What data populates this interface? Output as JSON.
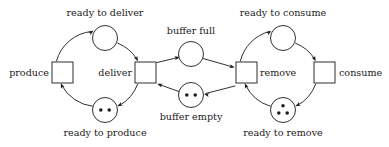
{
  "diagram": {
    "kind": "petri-net",
    "colors": {
      "stroke": "#1a1a1a",
      "fill": "#ffffff",
      "token": "#1a1a1a",
      "background": "#ffffff"
    },
    "places": [
      {
        "id": "ready-to-deliver",
        "label": "ready to deliver",
        "tokens": 0,
        "cx": 105,
        "cy": 38,
        "r": 12.5,
        "label_x": 105,
        "label_y": 16,
        "label_anchor": "middle"
      },
      {
        "id": "ready-to-produce",
        "label": "ready to produce",
        "tokens": 2,
        "cx": 105,
        "cy": 110,
        "r": 12.5,
        "label_x": 105,
        "label_y": 136,
        "label_anchor": "middle"
      },
      {
        "id": "buffer-full",
        "label": "buffer full",
        "tokens": 0,
        "cx": 191,
        "cy": 54,
        "r": 12.5,
        "label_x": 191,
        "label_y": 34,
        "label_anchor": "middle"
      },
      {
        "id": "buffer-empty",
        "label": "buffer empty",
        "tokens": 2,
        "cx": 191,
        "cy": 95,
        "r": 12.5,
        "label_x": 191,
        "label_y": 120,
        "label_anchor": "middle"
      },
      {
        "id": "ready-to-consume",
        "label": "ready to consume",
        "tokens": 0,
        "cx": 283,
        "cy": 38,
        "r": 12.5,
        "label_x": 283,
        "label_y": 16,
        "label_anchor": "middle"
      },
      {
        "id": "ready-to-remove",
        "label": "ready to remove",
        "tokens": 3,
        "cx": 283,
        "cy": 110,
        "r": 12.5,
        "label_x": 283,
        "label_y": 136,
        "label_anchor": "middle"
      }
    ],
    "transitions": [
      {
        "id": "produce",
        "label": "produce",
        "x": 52,
        "y": 62,
        "w": 21,
        "h": 21,
        "label_x": 49,
        "label_y": 76,
        "label_anchor": "end"
      },
      {
        "id": "deliver",
        "label": "deliver",
        "x": 135,
        "y": 62,
        "w": 21,
        "h": 21,
        "label_x": 132,
        "label_y": 76,
        "label_anchor": "end"
      },
      {
        "id": "remove",
        "label": "remove",
        "x": 236,
        "y": 62,
        "w": 21,
        "h": 21,
        "label_x": 260,
        "label_y": 76,
        "label_anchor": "start"
      },
      {
        "id": "consume",
        "label": "consume",
        "x": 314,
        "y": 62,
        "w": 21,
        "h": 21,
        "label_x": 339,
        "label_y": 76,
        "label_anchor": "start"
      }
    ],
    "arcs": [
      {
        "id": "produce-to-ready-to-deliver",
        "from": "produce",
        "to": "ready-to-deliver",
        "d": "M 56.5 61 A 40 40 0 0 1 91.5 31.5",
        "head": {
          "x": 93.5,
          "y": 30.6,
          "angle": -36
        }
      },
      {
        "id": "ready-to-deliver-to-deliver",
        "from": "ready-to-deliver",
        "to": "deliver",
        "d": "M 117.8 43.2 A 40 40 0 0 1 137 59.2",
        "head": {
          "x": 137.8,
          "y": 61.2,
          "angle": 64
        }
      },
      {
        "id": "deliver-to-ready-to-produce",
        "from": "deliver",
        "to": "ready-to-produce",
        "d": "M 137.6 84.2 A 40 40 0 0 1 119.2 105.6",
        "head": {
          "x": 117.4,
          "y": 106.3,
          "angle": 152
        }
      },
      {
        "id": "ready-to-produce-to-produce",
        "from": "ready-to-produce",
        "to": "produce",
        "d": "M 92.3 106.2 A 40 40 0 0 1 61.6 85.2",
        "head": {
          "x": 60.8,
          "y": 83.3,
          "angle": 247
        }
      },
      {
        "id": "deliver-to-buffer-full",
        "from": "deliver",
        "to": "buffer-full",
        "d": "M 157 62.5 L 177.8 57.6",
        "head": {
          "x": 179.8,
          "y": 57.1,
          "angle": -13
        }
      },
      {
        "id": "buffer-full-to-remove",
        "from": "buffer-full",
        "to": "remove",
        "d": "M 202.6 58.4 L 232.6 66.9",
        "head": {
          "x": 234.7,
          "y": 67.5,
          "angle": 16
        }
      },
      {
        "id": "remove-to-buffer-empty",
        "from": "remove",
        "to": "buffer-empty",
        "d": "M 235 86 L 206 93.4",
        "head": {
          "x": 204,
          "y": 93.9,
          "angle": 194
        }
      },
      {
        "id": "buffer-empty-to-deliver",
        "from": "buffer-empty",
        "to": "deliver",
        "d": "M 178.8 91.5 L 159.2 84.5",
        "head": {
          "x": 157.2,
          "y": 83.8,
          "angle": 200
        }
      },
      {
        "id": "remove-to-ready-to-consume",
        "from": "remove",
        "to": "ready-to-consume",
        "d": "M 240.4 61 A 40 40 0 0 1 269.4 31.5",
        "head": {
          "x": 271.4,
          "y": 30.9,
          "angle": -32
        }
      },
      {
        "id": "ready-to-consume-to-consume",
        "from": "ready-to-consume",
        "to": "consume",
        "d": "M 295.6 43.2 A 40 40 0 0 1 314.8 59.2",
        "head": {
          "x": 315.6,
          "y": 61.2,
          "angle": 64
        }
      },
      {
        "id": "consume-to-ready-to-remove",
        "from": "consume",
        "to": "ready-to-remove",
        "d": "M 315.6 84.2 A 40 40 0 0 1 297.2 105.6",
        "head": {
          "x": 295.4,
          "y": 106.3,
          "angle": 152
        }
      },
      {
        "id": "ready-to-remove-to-remove",
        "from": "ready-to-remove",
        "to": "remove",
        "d": "M 270.3 106.2 A 40 40 0 0 1 245.6 85.2",
        "head": {
          "x": 244.8,
          "y": 83.3,
          "angle": 247
        }
      }
    ]
  }
}
